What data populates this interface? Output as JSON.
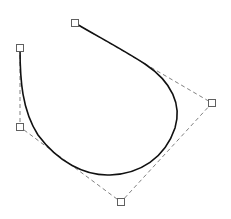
{
  "diagram": {
    "type": "bezier-curve-editor",
    "control_points": [
      {
        "id": "p0",
        "x": 20,
        "y": 48
      },
      {
        "id": "p1",
        "x": 20,
        "y": 127
      },
      {
        "id": "p2",
        "x": 121,
        "y": 202
      },
      {
        "id": "p3",
        "x": 212,
        "y": 103
      },
      {
        "id": "p4",
        "x": 75,
        "y": 23
      }
    ],
    "curve_path": "M 20 48 C 20 80, 22 110, 38 135 C 58 162, 85 176, 110 175 C 140 174, 165 158, 175 128 C 182 105, 172 82, 145 64 C 120 48, 95 35, 75 23",
    "colors": {
      "curve": "#111111",
      "control_polygon": "#808080",
      "handle_stroke": "#606060",
      "handle_fill": "#ffffff",
      "background": "#ffffff"
    }
  }
}
